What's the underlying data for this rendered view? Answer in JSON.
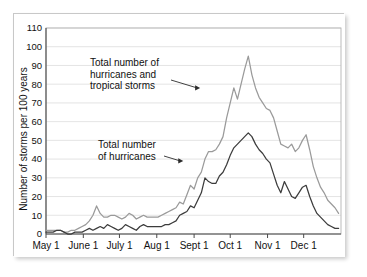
{
  "chart_data": {
    "type": "line",
    "title": "",
    "xlabel": "",
    "ylabel": "Number of storms per 100 years",
    "ylim": [
      0,
      110
    ],
    "ytick_labels": [
      "0",
      "10",
      "20",
      "30",
      "40",
      "50",
      "60",
      "70",
      "80",
      "90",
      "100",
      "110"
    ],
    "ytick_values": [
      0,
      10,
      20,
      30,
      40,
      50,
      60,
      70,
      80,
      90,
      100,
      110
    ],
    "xtick_labels": [
      "May 1",
      "June 1",
      "July 1",
      "Aug 1",
      "Sept 1",
      "Oct 1",
      "Nov 1",
      "Dec 1"
    ],
    "xtick_day_of_year_offsets": [
      0,
      31,
      61,
      92,
      123,
      153,
      184,
      214
    ],
    "x_range_days": [
      0,
      245
    ],
    "grid": "horizontal",
    "legend_position": "inline-annotations",
    "annotations": [
      {
        "name": "total-storms-annotation",
        "line1": "Total number of",
        "line2": "hurricanes and",
        "line3": "tropical storms",
        "points_to_day": 128,
        "points_to_value": 78
      },
      {
        "name": "total-hurricanes-annotation",
        "line1": "Total number",
        "line2": "of hurricanes",
        "points_to_day": 114,
        "points_to_value": 39
      }
    ],
    "series": [
      {
        "name": "Total number of hurricanes and tropical storms",
        "color": "#9a9a9a",
        "x": [
          0,
          3,
          6,
          9,
          12,
          15,
          18,
          21,
          24,
          27,
          30,
          33,
          36,
          39,
          42,
          45,
          48,
          51,
          54,
          57,
          60,
          63,
          66,
          69,
          72,
          75,
          78,
          81,
          84,
          87,
          90,
          93,
          96,
          99,
          102,
          105,
          108,
          111,
          114,
          117,
          120,
          123,
          126,
          129,
          132,
          135,
          138,
          141,
          144,
          147,
          150,
          153,
          156,
          159,
          162,
          165,
          168,
          171,
          174,
          177,
          180,
          183,
          186,
          189,
          192,
          195,
          198,
          201,
          204,
          207,
          210,
          213,
          216,
          219,
          222,
          225,
          228,
          231,
          234,
          237,
          240,
          243
        ],
        "y": [
          2,
          2,
          2,
          2,
          2,
          1,
          1,
          2,
          2,
          3,
          4,
          5,
          7,
          10,
          15,
          11,
          9,
          9,
          10,
          10,
          9,
          8,
          9,
          11,
          10,
          8,
          9,
          10,
          9,
          9,
          9,
          9,
          10,
          11,
          12,
          13,
          14,
          17,
          16,
          21,
          26,
          24,
          30,
          33,
          40,
          44,
          44,
          45,
          48,
          52,
          62,
          70,
          78,
          72,
          80,
          88,
          95,
          85,
          78,
          73,
          70,
          67,
          66,
          62,
          55,
          48,
          47,
          46,
          48,
          44,
          46,
          50,
          53,
          45,
          36,
          30,
          25,
          22,
          18,
          16,
          14,
          11
        ]
      },
      {
        "name": "Total number of hurricanes",
        "color": "#3c3c3c",
        "x": [
          0,
          3,
          6,
          9,
          12,
          15,
          18,
          21,
          24,
          27,
          30,
          33,
          36,
          39,
          42,
          45,
          48,
          51,
          54,
          57,
          60,
          63,
          66,
          69,
          72,
          75,
          78,
          81,
          84,
          87,
          90,
          93,
          96,
          99,
          102,
          105,
          108,
          111,
          114,
          117,
          120,
          123,
          126,
          129,
          132,
          135,
          138,
          141,
          144,
          147,
          150,
          153,
          156,
          159,
          162,
          165,
          168,
          171,
          174,
          177,
          180,
          183,
          186,
          189,
          192,
          195,
          198,
          201,
          204,
          207,
          210,
          213,
          216,
          219,
          222,
          225,
          228,
          231,
          234,
          237,
          240,
          243
        ],
        "y": [
          1,
          1,
          1,
          2,
          2,
          1,
          0,
          0,
          1,
          1,
          1,
          2,
          3,
          2,
          3,
          4,
          3,
          5,
          4,
          3,
          2,
          3,
          5,
          4,
          3,
          2,
          4,
          5,
          4,
          4,
          4,
          4,
          4,
          5,
          5,
          6,
          7,
          10,
          11,
          12,
          15,
          14,
          18,
          22,
          30,
          28,
          27,
          27,
          31,
          33,
          37,
          42,
          46,
          48,
          50,
          52,
          54,
          52,
          48,
          45,
          43,
          40,
          38,
          32,
          26,
          22,
          28,
          24,
          20,
          19,
          22,
          25,
          26,
          20,
          15,
          11,
          9,
          7,
          5,
          4,
          3,
          3
        ]
      }
    ]
  }
}
